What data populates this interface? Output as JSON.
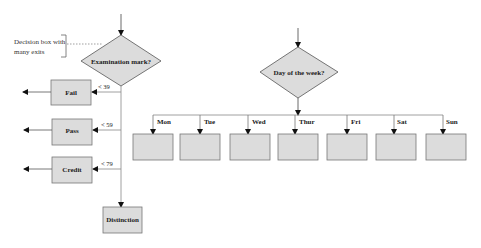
{
  "annotation": {
    "line1": "Decision box with",
    "line2": "many exits"
  },
  "decision1": {
    "label": "Examination mark?",
    "branches": [
      {
        "condition": "< 39",
        "outcome": "Fail"
      },
      {
        "condition": "< 59",
        "outcome": "Pass"
      },
      {
        "condition": "< 79",
        "outcome": "Credit"
      }
    ],
    "default_outcome": "Distinction"
  },
  "decision2": {
    "label": "Day of the week?",
    "branches": [
      "Mon",
      "Tue",
      "Wed",
      "Thur",
      "Fri",
      "Sat",
      "Sun"
    ]
  },
  "colors": {
    "box_fill": "#dcdcdc",
    "stroke": "#555555",
    "line": "#888888"
  }
}
